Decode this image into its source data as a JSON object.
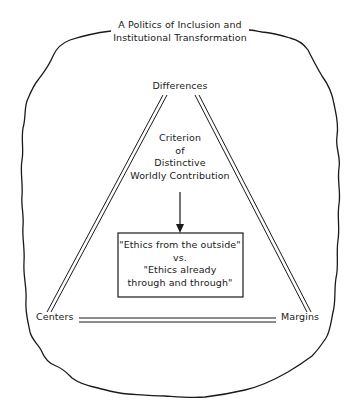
{
  "diagram": {
    "title": {
      "line1": "A Politics of Inclusion and",
      "line2": "Institutional Transformation"
    },
    "vertices": {
      "top": "Differences",
      "bottom_left": "Centers",
      "bottom_right": "Margins"
    },
    "criterion": {
      "line1": "Criterion",
      "line2": "of",
      "line3": "Distinctive",
      "line4": "Worldly Contribution"
    },
    "box": {
      "line1": "\"Ethics from the outside\"",
      "line2": "vs.",
      "line3": "\"Ethics already",
      "line4": "through and through\""
    },
    "colors": {
      "stroke": "#1a1a1a",
      "background": "#ffffff"
    }
  }
}
